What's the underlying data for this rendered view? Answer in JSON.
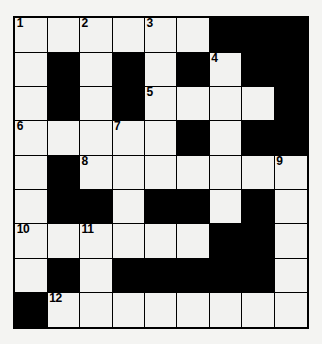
{
  "puzzle": {
    "title": "Crossword Grid",
    "type": "crossword",
    "rows": 9,
    "cols": 9,
    "colors": {
      "page_background": "#f4f4f2",
      "cell_white": "#f2f2f0",
      "cell_black": "#000000",
      "grid_line": "#000000",
      "number_text": "#000000"
    },
    "legend": {
      "white_cell": "white-cell",
      "black_cell": "black-cell"
    },
    "grid": [
      [
        {
          "state": "white",
          "number": "1"
        },
        {
          "state": "white",
          "number": ""
        },
        {
          "state": "white",
          "number": "2"
        },
        {
          "state": "white",
          "number": ""
        },
        {
          "state": "white",
          "number": "3"
        },
        {
          "state": "white",
          "number": ""
        },
        {
          "state": "black",
          "number": ""
        },
        {
          "state": "black",
          "number": ""
        },
        {
          "state": "black",
          "number": ""
        }
      ],
      [
        {
          "state": "white",
          "number": ""
        },
        {
          "state": "black",
          "number": ""
        },
        {
          "state": "white",
          "number": ""
        },
        {
          "state": "black",
          "number": ""
        },
        {
          "state": "white",
          "number": ""
        },
        {
          "state": "black",
          "number": ""
        },
        {
          "state": "white",
          "number": "4"
        },
        {
          "state": "black",
          "number": ""
        },
        {
          "state": "black",
          "number": ""
        }
      ],
      [
        {
          "state": "white",
          "number": ""
        },
        {
          "state": "black",
          "number": ""
        },
        {
          "state": "white",
          "number": ""
        },
        {
          "state": "black",
          "number": ""
        },
        {
          "state": "white",
          "number": "5"
        },
        {
          "state": "white",
          "number": ""
        },
        {
          "state": "white",
          "number": ""
        },
        {
          "state": "white",
          "number": ""
        },
        {
          "state": "black",
          "number": ""
        }
      ],
      [
        {
          "state": "white",
          "number": "6"
        },
        {
          "state": "white",
          "number": ""
        },
        {
          "state": "white",
          "number": ""
        },
        {
          "state": "white",
          "number": "7"
        },
        {
          "state": "white",
          "number": ""
        },
        {
          "state": "black",
          "number": ""
        },
        {
          "state": "white",
          "number": ""
        },
        {
          "state": "black",
          "number": ""
        },
        {
          "state": "black",
          "number": ""
        }
      ],
      [
        {
          "state": "white",
          "number": ""
        },
        {
          "state": "black",
          "number": ""
        },
        {
          "state": "white",
          "number": "8"
        },
        {
          "state": "white",
          "number": ""
        },
        {
          "state": "white",
          "number": ""
        },
        {
          "state": "white",
          "number": ""
        },
        {
          "state": "white",
          "number": ""
        },
        {
          "state": "white",
          "number": ""
        },
        {
          "state": "white",
          "number": "9"
        }
      ],
      [
        {
          "state": "white",
          "number": ""
        },
        {
          "state": "black",
          "number": ""
        },
        {
          "state": "black",
          "number": ""
        },
        {
          "state": "white",
          "number": ""
        },
        {
          "state": "black",
          "number": ""
        },
        {
          "state": "black",
          "number": ""
        },
        {
          "state": "white",
          "number": ""
        },
        {
          "state": "black",
          "number": ""
        },
        {
          "state": "white",
          "number": ""
        }
      ],
      [
        {
          "state": "white",
          "number": "10"
        },
        {
          "state": "white",
          "number": ""
        },
        {
          "state": "white",
          "number": "11"
        },
        {
          "state": "white",
          "number": ""
        },
        {
          "state": "white",
          "number": ""
        },
        {
          "state": "white",
          "number": ""
        },
        {
          "state": "black",
          "number": ""
        },
        {
          "state": "black",
          "number": ""
        },
        {
          "state": "white",
          "number": ""
        }
      ],
      [
        {
          "state": "white",
          "number": ""
        },
        {
          "state": "black",
          "number": ""
        },
        {
          "state": "white",
          "number": ""
        },
        {
          "state": "black",
          "number": ""
        },
        {
          "state": "black",
          "number": ""
        },
        {
          "state": "black",
          "number": ""
        },
        {
          "state": "black",
          "number": ""
        },
        {
          "state": "black",
          "number": ""
        },
        {
          "state": "white",
          "number": ""
        }
      ],
      [
        {
          "state": "black",
          "number": ""
        },
        {
          "state": "white",
          "number": "12"
        },
        {
          "state": "white",
          "number": ""
        },
        {
          "state": "white",
          "number": ""
        },
        {
          "state": "white",
          "number": ""
        },
        {
          "state": "white",
          "number": ""
        },
        {
          "state": "white",
          "number": ""
        },
        {
          "state": "white",
          "number": ""
        },
        {
          "state": "white",
          "number": ""
        }
      ]
    ]
  }
}
